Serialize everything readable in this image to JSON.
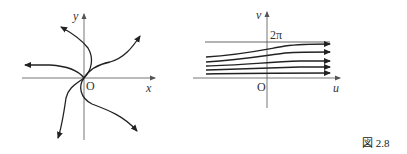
{
  "figure": {
    "caption": "図 2.8",
    "left_panel": {
      "x_label": "x",
      "y_label": "y",
      "origin_label": "O",
      "description": "Phase portrait: six trajectories spiralling out from the origin with arrows pointing outward"
    },
    "right_panel": {
      "x_label": "u",
      "y_label": "v",
      "origin_label": "O",
      "level_label": "2π",
      "description": "Trajectories in (u,v) plane: five curves flowing rightward, approaching horizontal lines, bounded above by v = 2π"
    }
  }
}
